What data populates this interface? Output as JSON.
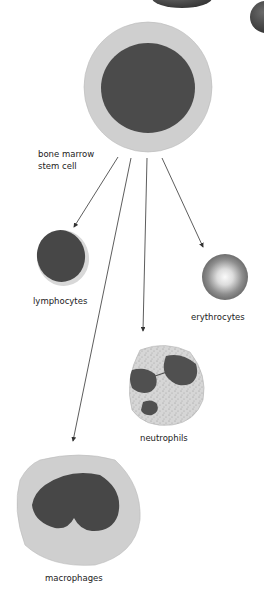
{
  "diagram": {
    "source": {
      "label_line1": "bone marrow",
      "label_line2": "stem cell"
    },
    "targets": [
      {
        "id": "lymphocytes",
        "label": "lymphocytes"
      },
      {
        "id": "erythrocytes",
        "label": "erythrocytes"
      },
      {
        "id": "neutrophils",
        "label": "neutrophils"
      },
      {
        "id": "macrophages",
        "label": "macrophages"
      }
    ],
    "colors": {
      "cytoplasm": "#cfcfcf",
      "nucleus": "#4a4a4a",
      "arrow": "#333333",
      "erythrocyte_center": "#f2f2f2",
      "erythrocyte_edge": "#7a7a7a"
    }
  }
}
